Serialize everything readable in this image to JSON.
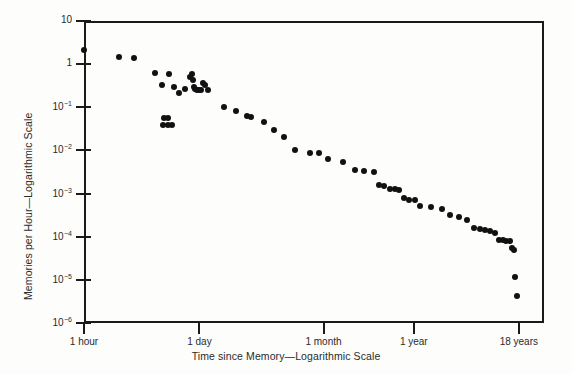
{
  "chart_data": {
    "type": "scatter",
    "title": "",
    "xlabel": "Time since Memory—Logarithmic Scale",
    "ylabel": "Memories per Hour—Logarithmic Scale",
    "xscale": "log",
    "yscale": "log",
    "grid": false,
    "legend": null,
    "xtick_labels": [
      "1 hour",
      "1 day",
      "1 month",
      "1 year",
      "18 years"
    ],
    "xtick_hours": [
      1,
      24,
      730,
      8760,
      157680
    ],
    "ytick_labels": [
      "10",
      "1",
      "10-1",
      "10-2",
      "10-3",
      "10-4",
      "10-5",
      "10-6"
    ],
    "ytick_values": [
      10,
      1,
      0.1,
      0.01,
      0.001,
      0.0001,
      1e-05,
      1e-06
    ],
    "ylim": [
      1e-06,
      10
    ],
    "xlim_hours": [
      1,
      315360
    ],
    "series_name": "memories per hour",
    "points": [
      {
        "x_hours": 1.0,
        "y": 2.1
      },
      {
        "x_hours": 2.6,
        "y": 1.45
      },
      {
        "x_hours": 4.0,
        "y": 1.4
      },
      {
        "x_hours": 7.0,
        "y": 0.62
      },
      {
        "x_hours": 8.5,
        "y": 0.33
      },
      {
        "x_hours": 10.5,
        "y": 0.6
      },
      {
        "x_hours": 12.0,
        "y": 0.3
      },
      {
        "x_hours": 13.5,
        "y": 0.21
      },
      {
        "x_hours": 9.0,
        "y": 0.055
      },
      {
        "x_hours": 10.2,
        "y": 0.057
      },
      {
        "x_hours": 8.8,
        "y": 0.038
      },
      {
        "x_hours": 10.0,
        "y": 0.039
      },
      {
        "x_hours": 11.2,
        "y": 0.039
      },
      {
        "x_hours": 16.0,
        "y": 0.26
      },
      {
        "x_hours": 18.5,
        "y": 0.5
      },
      {
        "x_hours": 19.5,
        "y": 0.58
      },
      {
        "x_hours": 20.0,
        "y": 0.42
      },
      {
        "x_hours": 20.5,
        "y": 0.3
      },
      {
        "x_hours": 21.5,
        "y": 0.27
      },
      {
        "x_hours": 22.5,
        "y": 0.25
      },
      {
        "x_hours": 23.5,
        "y": 0.25
      },
      {
        "x_hours": 25.0,
        "y": 0.25
      },
      {
        "x_hours": 26.5,
        "y": 0.36
      },
      {
        "x_hours": 28.0,
        "y": 0.33
      },
      {
        "x_hours": 30.0,
        "y": 0.25
      },
      {
        "x_hours": 47.0,
        "y": 0.1
      },
      {
        "x_hours": 66.0,
        "y": 0.082
      },
      {
        "x_hours": 88.0,
        "y": 0.062
      },
      {
        "x_hours": 100.0,
        "y": 0.058
      },
      {
        "x_hours": 140.0,
        "y": 0.045
      },
      {
        "x_hours": 185.0,
        "y": 0.03
      },
      {
        "x_hours": 245.0,
        "y": 0.021
      },
      {
        "x_hours": 330.0,
        "y": 0.0105
      },
      {
        "x_hours": 500.0,
        "y": 0.0088
      },
      {
        "x_hours": 640.0,
        "y": 0.0086
      },
      {
        "x_hours": 830.0,
        "y": 0.0062
      },
      {
        "x_hours": 1250.0,
        "y": 0.0055
      },
      {
        "x_hours": 1750.0,
        "y": 0.0036
      },
      {
        "x_hours": 2250.0,
        "y": 0.0033
      },
      {
        "x_hours": 2900.0,
        "y": 0.0031
      },
      {
        "x_hours": 3400.0,
        "y": 0.0016
      },
      {
        "x_hours": 3900.0,
        "y": 0.0015
      },
      {
        "x_hours": 4600.0,
        "y": 0.0013
      },
      {
        "x_hours": 5200.0,
        "y": 0.00125
      },
      {
        "x_hours": 5900.0,
        "y": 0.00122
      },
      {
        "x_hours": 6700.0,
        "y": 0.00078
      },
      {
        "x_hours": 7600.0,
        "y": 0.00072
      },
      {
        "x_hours": 9000.0,
        "y": 0.0007
      },
      {
        "x_hours": 10500.0,
        "y": 0.00052
      },
      {
        "x_hours": 14000.0,
        "y": 0.00048
      },
      {
        "x_hours": 19000.0,
        "y": 0.00044
      },
      {
        "x_hours": 24000.0,
        "y": 0.00032
      },
      {
        "x_hours": 30000.0,
        "y": 0.00028
      },
      {
        "x_hours": 38000.0,
        "y": 0.00024
      },
      {
        "x_hours": 46000.0,
        "y": 0.00016
      },
      {
        "x_hours": 54000.0,
        "y": 0.000155
      },
      {
        "x_hours": 63000.0,
        "y": 0.00014
      },
      {
        "x_hours": 72000.0,
        "y": 0.000135
      },
      {
        "x_hours": 82000.0,
        "y": 0.000125
      },
      {
        "x_hours": 92000.0,
        "y": 8.5e-05
      },
      {
        "x_hours": 102000.0,
        "y": 8.2e-05
      },
      {
        "x_hours": 112000.0,
        "y": 8e-05
      },
      {
        "x_hours": 124000.0,
        "y": 7.9e-05
      },
      {
        "x_hours": 132000.0,
        "y": 5.6e-05
      },
      {
        "x_hours": 138000.0,
        "y": 4.8e-05
      },
      {
        "x_hours": 143000.0,
        "y": 1.15e-05
      },
      {
        "x_hours": 150000.0,
        "y": 4.2e-06
      }
    ]
  }
}
